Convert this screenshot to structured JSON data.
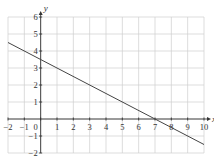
{
  "chart_data": {
    "type": "line",
    "title": "",
    "xlabel": "x",
    "ylabel": "y",
    "xlim": [
      -2,
      10
    ],
    "ylim": [
      -2,
      6
    ],
    "grid": true,
    "x_ticks": [
      -2,
      -1,
      0,
      1,
      2,
      3,
      4,
      5,
      6,
      7,
      8,
      9,
      10
    ],
    "y_ticks": [
      -2,
      -1,
      1,
      2,
      3,
      4,
      5,
      6
    ],
    "x_tick_labels": [
      "−2",
      "−1",
      "0",
      "1",
      "2",
      "3",
      "4",
      "5",
      "6",
      "7",
      "8",
      "9",
      "10"
    ],
    "y_tick_labels": [
      "−2",
      "−1",
      "1",
      "2",
      "3",
      "4",
      "5",
      "6"
    ],
    "series": [
      {
        "name": "line",
        "equation": "y = 3.5 - 0.5x",
        "x": [
          -2,
          0,
          7,
          10
        ],
        "y": [
          4.5,
          3.5,
          0,
          -1.5
        ]
      }
    ],
    "colors": {
      "grid": "#cfcfcf",
      "axis": "#333333",
      "line": "#444444"
    }
  }
}
